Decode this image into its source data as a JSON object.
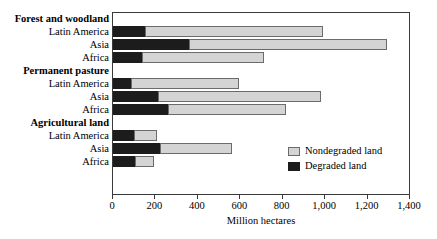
{
  "chart_data": {
    "type": "bar",
    "orientation": "horizontal",
    "stacked": true,
    "title": "",
    "xlabel": "Million hectares",
    "ylabel": "",
    "xlim": [
      0,
      1400
    ],
    "xticks": [
      0,
      200,
      400,
      600,
      800,
      1000,
      1200,
      1400
    ],
    "xtick_labels": [
      "0",
      "200",
      "400",
      "600",
      "800",
      "1,000",
      "1,200",
      "1,400"
    ],
    "grid": false,
    "legend_position": "inside-right",
    "legend": [
      {
        "label": "Nondegraded land",
        "color": "#d4d4d4",
        "key": "nondegraded"
      },
      {
        "label": "Degraded land",
        "color": "#1c1c1c",
        "key": "degraded"
      }
    ],
    "series": [
      {
        "name": "Degraded land",
        "key": "degraded",
        "color": "#1c1c1c"
      },
      {
        "name": "Nondegraded land",
        "key": "nondegraded",
        "color": "#d4d4d4"
      }
    ],
    "groups": [
      {
        "label": "Forest and woodland",
        "rows": [
          {
            "label": "Latin America",
            "degraded": 152,
            "nondegraded": 838,
            "total": 990
          },
          {
            "label": "Asia",
            "degraded": 357,
            "nondegraded": 935,
            "total": 1292
          },
          {
            "label": "Africa",
            "degraded": 137,
            "nondegraded": 573,
            "total": 710
          }
        ]
      },
      {
        "label": "Permanent pasture",
        "rows": [
          {
            "label": "Latin America",
            "degraded": 85,
            "nondegraded": 508,
            "total": 593
          },
          {
            "label": "Asia",
            "degraded": 210,
            "nondegraded": 771,
            "total": 981
          },
          {
            "label": "Africa",
            "degraded": 258,
            "nondegraded": 559,
            "total": 817
          }
        ]
      },
      {
        "label": "Agricultural land",
        "rows": [
          {
            "label": "Latin America",
            "degraded": 101,
            "nondegraded": 106,
            "total": 207
          },
          {
            "label": "Asia",
            "degraded": 220,
            "nondegraded": 341,
            "total": 561
          },
          {
            "label": "Africa",
            "degraded": 104,
            "nondegraded": 91,
            "total": 195
          }
        ]
      }
    ]
  }
}
